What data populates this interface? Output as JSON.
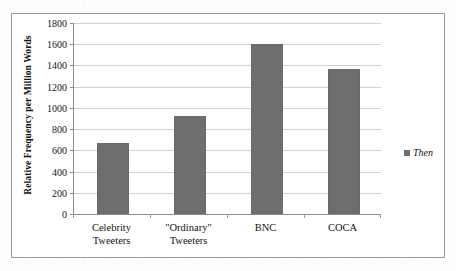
{
  "chart_data": {
    "type": "bar",
    "title": "",
    "xlabel": "",
    "ylabel": "Relative Frequency per Million Words",
    "categories": [
      "Celebrity\nTweeters",
      "\"Ordinary\"\nTweeters",
      "BNC",
      "COCA"
    ],
    "category_lines": [
      [
        "Celebrity",
        "Tweeters"
      ],
      [
        "\"Ordinary\"",
        "Tweeters"
      ],
      [
        "BNC",
        ""
      ],
      [
        "COCA",
        ""
      ]
    ],
    "series": [
      {
        "name": "Then",
        "values": [
          670,
          925,
          1600,
          1365
        ]
      }
    ],
    "values": [
      670,
      925,
      1600,
      1365
    ],
    "ylim": [
      0,
      1800
    ],
    "ytick_step": 200,
    "yticks": [
      1800,
      1600,
      1400,
      1200,
      1000,
      800,
      600,
      400,
      200,
      0
    ],
    "ytick_labels": [
      "1800",
      "1600",
      "1400",
      "1200",
      "1000",
      "800",
      "600",
      "400",
      "200",
      "0"
    ],
    "grid": true,
    "legend_position": "right",
    "legend": [
      {
        "label": "Then",
        "color": "#6e6e6e"
      }
    ],
    "colors": {
      "bar": "#6e6e6e",
      "gridline": "#d2d2d2",
      "axis": "#8c8c8c",
      "frame": "#9a9a9a",
      "text": "#131313",
      "background": "#ffffff"
    }
  }
}
